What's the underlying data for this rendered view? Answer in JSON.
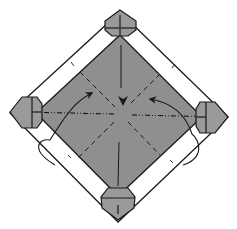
{
  "diagram": {
    "type": "origami-fold-diagram",
    "colors": {
      "paper_front": "#8f8f8f",
      "paper_flap": "#9a9a9a",
      "paper_back": "#ffffff",
      "line": "#1a1a1a",
      "background": "#ffffff"
    },
    "elements": {
      "main_diamond": {
        "top": [
          120,
          35
        ],
        "right": [
          202,
          117
        ],
        "bottom": [
          118,
          196
        ],
        "left": [
          36,
          113
        ]
      },
      "outer_square": {
        "top": [
          120,
          12
        ],
        "right": [
          228,
          117
        ],
        "bottom": [
          118,
          222
        ],
        "left": [
          10,
          113
        ]
      },
      "corner_flaps": [
        "top",
        "right",
        "bottom",
        "left"
      ],
      "creases": {
        "valley_vertical": "center vertical solid line",
        "mountain_horizontal": "dash-dot line across center",
        "valley_diagonals": "dashed diagonal lines through center"
      },
      "arrows": [
        {
          "name": "left-fold-arrow",
          "from": "lower-left outside loop",
          "to": [
            92,
            93
          ]
        },
        {
          "name": "right-fold-arrow",
          "from": "lower-right outside loop",
          "to": [
            150,
            99
          ]
        }
      ],
      "center_marker": {
        "symbol": "filled arrowhead",
        "position": [
          123,
          101
        ]
      }
    }
  }
}
